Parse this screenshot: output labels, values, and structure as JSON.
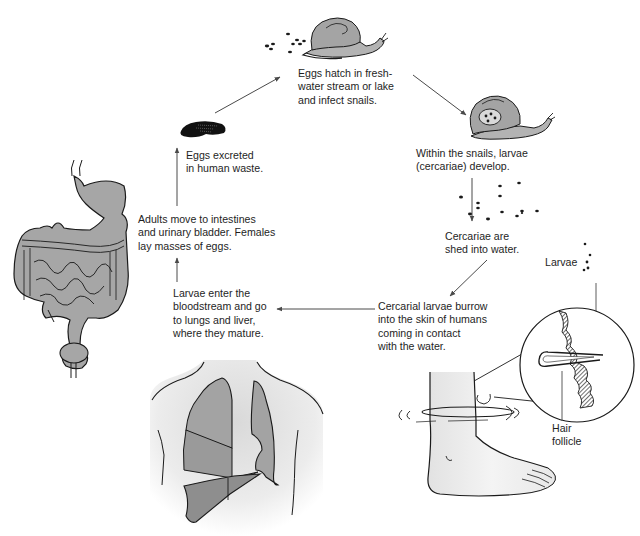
{
  "diagram": {
    "type": "life-cycle",
    "colors": {
      "line": "#1a1a1a",
      "arrow": "#555555",
      "organ_fill": "#a6a6a6",
      "organ_fill_dark": "#8f8f8f",
      "skin_fill": "#eeeeee",
      "snail_fill": "#a9a9a9",
      "background": "#ffffff"
    },
    "steps": [
      {
        "id": "eggs-hatch",
        "text": "Eggs hatch in fresh-\nwater stream or lake\nand infect snails."
      },
      {
        "id": "larvae-develop",
        "text": "Within the snails, larvae\n(cercariae) develop."
      },
      {
        "id": "cercariae-shed",
        "text": "Cercariae are\nshed into water."
      },
      {
        "id": "larvae-burrow",
        "text": "Cercarial larvae burrow\ninto the skin of humans\ncoming in contact\nwith the water."
      },
      {
        "id": "larvae-bloodstream",
        "text": "Larvae enter the\nbloodstream and go\nto lungs and liver,\nwhere they mature."
      },
      {
        "id": "adults-move",
        "text": "Adults move to intestines\nand urinary bladder. Females\nlay masses of eggs."
      },
      {
        "id": "eggs-excreted",
        "text": "Eggs excreted\nin human waste."
      }
    ],
    "callouts": {
      "larvae": "Larvae",
      "hair_follicle": "Hair\nfollicle"
    },
    "illustrations": [
      "snail-with-eggs",
      "infected-snail",
      "cercariae-dots",
      "foot-in-water",
      "skin-magnified-circle",
      "chest-lungs-liver",
      "digestive-tract-bladder",
      "egg-mass"
    ]
  }
}
